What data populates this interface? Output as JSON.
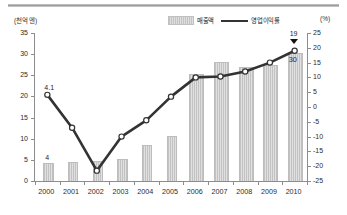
{
  "axes": {
    "left_unit": "(천억 엔)",
    "right_unit": "(%)"
  },
  "legend": [
    {
      "name": "bar-series",
      "label": "매출액",
      "marker": "bar-swatch",
      "color": "#d4d4d4"
    },
    {
      "name": "line-series",
      "label": "영업이익률",
      "marker": "line-swatch",
      "color": "#333333"
    }
  ],
  "annotations": [
    {
      "name": "line-first-value",
      "text": "4.1"
    },
    {
      "name": "bar-first-value",
      "text": "4"
    },
    {
      "name": "line-last-value",
      "text": "19"
    },
    {
      "name": "bar-last-value",
      "text": "30"
    }
  ],
  "chart_data": {
    "type": "bar",
    "title": "",
    "xlabel": "",
    "ylabel": "(천억 엔)",
    "categories": [
      "2000",
      "2001",
      "2002",
      "2003",
      "2004",
      "2005",
      "2006",
      "2007",
      "2008",
      "2009",
      "2010"
    ],
    "series": [
      {
        "name": "매출액",
        "type": "bar",
        "axis": "left",
        "unit": "천억 엔",
        "color": "#d4d4d4",
        "values": [
          4,
          4.2,
          4.6,
          5.0,
          8.2,
          10.4,
          25.0,
          27.8,
          26.8,
          27.2,
          30.0
        ]
      },
      {
        "name": "영업이익률",
        "type": "line",
        "axis": "right",
        "unit": "%",
        "color": "#333333",
        "values": [
          4.1,
          -7.0,
          -21.5,
          -10.0,
          -4.5,
          3.5,
          10.0,
          10.3,
          12.0,
          15.0,
          19.0
        ]
      }
    ],
    "ylim": [
      0,
      35
    ],
    "yticks": [
      0,
      5,
      10,
      15,
      20,
      25,
      30,
      35
    ],
    "y2lim": [
      -25,
      25
    ],
    "y2ticks": [
      -25,
      -20,
      -15,
      -10,
      -5,
      0,
      5,
      10,
      15,
      20,
      25
    ],
    "y2label": "(%)",
    "grid": false,
    "legend_position": "top-center"
  }
}
